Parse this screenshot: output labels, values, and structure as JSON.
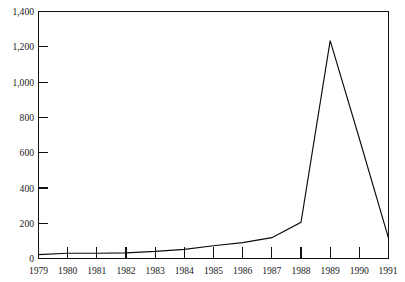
{
  "chart_data": {
    "type": "line",
    "title": "",
    "subtitle": "",
    "xlabel": "",
    "ylabel": "",
    "categories": [
      "1979",
      "1980",
      "1981",
      "1982",
      "1983",
      "1984",
      "1985",
      "1986",
      "1987",
      "1988",
      "1989",
      "1990",
      "1991"
    ],
    "x": [
      1979,
      1980,
      1981,
      1982,
      1983,
      1984,
      1985,
      1986,
      1987,
      1988,
      1989,
      1990,
      1991
    ],
    "values": [
      22,
      30,
      30,
      32,
      40,
      52,
      72,
      90,
      118,
      205,
      1235,
      680,
      115
    ],
    "series": [
      {
        "name": "",
        "values": [
          22,
          30,
          30,
          32,
          40,
          52,
          72,
          90,
          118,
          205,
          1235,
          680,
          115
        ]
      }
    ],
    "xlim": [
      1979,
      1991
    ],
    "ylim": [
      0,
      1400
    ],
    "ytick_values": [
      0,
      200,
      400,
      600,
      800,
      1000,
      1200,
      1400
    ],
    "ytick_labels": [
      "0",
      "200",
      "400",
      "600",
      "800",
      "1,000",
      "1,200",
      "1,400"
    ],
    "xtick_labels": [
      "1979",
      "1980",
      "1981",
      "1982",
      "1983",
      "1984",
      "1985",
      "1986",
      "1987",
      "1988",
      "1989",
      "1990",
      "1991"
    ],
    "grid": false,
    "legend": false,
    "legend_position": "none",
    "annotations": [],
    "line_color": "#0d0d0d",
    "axis_color": "#111111",
    "background_color": "#ffffff"
  },
  "axes": {
    "y_labels": [
      "1,400",
      "1,200",
      "1,000",
      "800",
      "600",
      "400",
      "200",
      "0"
    ],
    "x_labels": [
      "1979",
      "1980",
      "1981",
      "1982",
      "1983",
      "1984",
      "1985",
      "1986",
      "1987",
      "1988",
      "1989",
      "1990",
      "1991"
    ]
  }
}
